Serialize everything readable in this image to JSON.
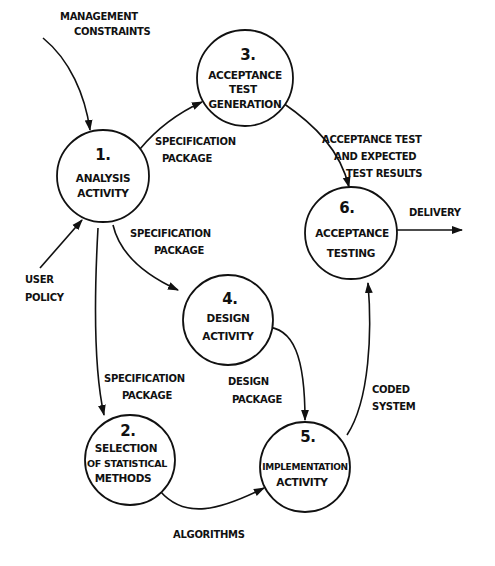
{
  "diagram": {
    "type": "data-flow-diagram",
    "colors": {
      "ink": "#111111",
      "background": "#ffffff"
    },
    "nodes": [
      {
        "id": "1",
        "number": "1.",
        "lines": [
          "ANALYSIS",
          "ACTIVITY"
        ]
      },
      {
        "id": "2",
        "number": "2.",
        "lines": [
          "SELECTION",
          "OF STATISTICAL",
          "METHODS"
        ]
      },
      {
        "id": "3",
        "number": "3.",
        "lines": [
          "ACCEPTANCE",
          "TEST",
          "GENERATION"
        ]
      },
      {
        "id": "4",
        "number": "4.",
        "lines": [
          "DESIGN",
          "ACTIVITY"
        ]
      },
      {
        "id": "5",
        "number": "5.",
        "lines": [
          "IMPLEMENTATION",
          "ACTIVITY"
        ]
      },
      {
        "id": "6",
        "number": "6.",
        "lines": [
          "ACCEPTANCE",
          "TESTING"
        ]
      }
    ],
    "flows": [
      {
        "from": "external",
        "to": "1",
        "lines": [
          "MANAGEMENT",
          "CONSTRAINTS"
        ]
      },
      {
        "from": "external",
        "to": "1",
        "lines": [
          "USER",
          "POLICY"
        ]
      },
      {
        "from": "1",
        "to": "3",
        "lines": [
          "SPECIFICATION",
          "PACKAGE"
        ]
      },
      {
        "from": "1",
        "to": "4",
        "lines": [
          "SPECIFICATION",
          "PACKAGE"
        ]
      },
      {
        "from": "1",
        "to": "2",
        "lines": [
          "SPECIFICATION",
          "PACKAGE"
        ]
      },
      {
        "from": "3",
        "to": "6",
        "lines": [
          "ACCEPTANCE TEST",
          "AND EXPECTED",
          "TEST RESULTS"
        ]
      },
      {
        "from": "4",
        "to": "5",
        "lines": [
          "DESIGN",
          "PACKAGE"
        ]
      },
      {
        "from": "2",
        "to": "5",
        "lines": [
          "ALGORITHMS"
        ]
      },
      {
        "from": "5",
        "to": "6",
        "lines": [
          "CODED",
          "SYSTEM"
        ]
      },
      {
        "from": "6",
        "to": "external",
        "lines": [
          "DELIVERY"
        ]
      }
    ]
  }
}
